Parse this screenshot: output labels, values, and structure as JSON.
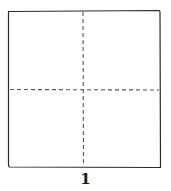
{
  "diagram": {
    "type": "origami-fold-step",
    "step_number": "1",
    "square": {
      "stroke": "#2a2a2a",
      "fill": "#ffffff"
    },
    "fold_lines": [
      {
        "kind": "valley-dashed",
        "orientation": "vertical",
        "color": "#555555"
      },
      {
        "kind": "valley-dashed",
        "orientation": "horizontal",
        "color": "#555555"
      }
    ]
  }
}
